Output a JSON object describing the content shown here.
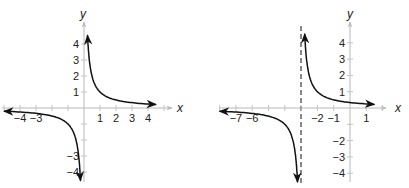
{
  "chart_data": [
    {
      "type": "line",
      "title": "",
      "function": "y = 1/x",
      "xlabel": "x",
      "ylabel": "y",
      "xlim": [
        -5,
        5
      ],
      "ylim": [
        -4.5,
        4.5
      ],
      "grid": false,
      "x_tick_labels": [
        "-4",
        "-3",
        "1",
        "2",
        "3",
        "4"
      ],
      "y_tick_labels": [
        "4",
        "3",
        "2",
        "1",
        "-3",
        "-4"
      ],
      "vertical_asymptote": 0,
      "horizontal_asymptote": 0,
      "series": [
        {
          "name": "right-branch",
          "x": [
            0.22,
            0.5,
            1,
            2,
            3,
            4.5
          ],
          "y": [
            4.5,
            2,
            1,
            0.5,
            0.33,
            0.22
          ]
        },
        {
          "name": "left-branch",
          "x": [
            -5,
            -4,
            -3,
            -2,
            -1,
            -0.5,
            -0.22
          ],
          "y": [
            -0.2,
            -0.25,
            -0.33,
            -0.5,
            -1,
            -2,
            -4.5
          ]
        }
      ]
    },
    {
      "type": "line",
      "title": "",
      "function": "y = 1/(x+3)",
      "xlabel": "x",
      "ylabel": "y",
      "xlim": [
        -8,
        2
      ],
      "ylim": [
        -4.5,
        4.5
      ],
      "grid": false,
      "x_tick_labels": [
        "-7",
        "-6",
        "-2",
        "-1",
        "1"
      ],
      "y_tick_labels": [
        "4",
        "3",
        "2",
        "1",
        "-2",
        "-3",
        "-4"
      ],
      "vertical_asymptote": -3,
      "vertical_asymptote_style": "dashed",
      "horizontal_asymptote": 0,
      "series": [
        {
          "name": "right-branch",
          "x": [
            -2.78,
            -2.5,
            -2,
            -1,
            0,
            1.5
          ],
          "y": [
            4.5,
            2,
            1,
            0.5,
            0.33,
            0.22
          ]
        },
        {
          "name": "left-branch",
          "x": [
            -8,
            -7,
            -6,
            -5,
            -4,
            -3.5,
            -3.22
          ],
          "y": [
            -0.2,
            -0.25,
            -0.33,
            -0.5,
            -1,
            -2,
            -4.5
          ]
        }
      ]
    }
  ],
  "graph1": {
    "x_axis_label": "x",
    "y_axis_label": "y",
    "x_ticks": [
      {
        "v": -4,
        "label": "−4"
      },
      {
        "v": -3,
        "label": "−3"
      },
      {
        "v": 1,
        "label": "1"
      },
      {
        "v": 2,
        "label": "2"
      },
      {
        "v": 3,
        "label": "3"
      },
      {
        "v": 4,
        "label": "4"
      }
    ],
    "y_ticks": [
      {
        "v": 4,
        "label": "4"
      },
      {
        "v": 3,
        "label": "3"
      },
      {
        "v": 2,
        "label": "2"
      },
      {
        "v": 1,
        "label": "1"
      },
      {
        "v": -3,
        "label": "−3"
      },
      {
        "v": -4,
        "label": "−4"
      }
    ]
  },
  "graph2": {
    "x_axis_label": "x",
    "y_axis_label": "y",
    "x_ticks": [
      {
        "v": -7,
        "label": "−7"
      },
      {
        "v": -6,
        "label": "−6"
      },
      {
        "v": -2,
        "label": "−2"
      },
      {
        "v": -1,
        "label": "−1"
      },
      {
        "v": 1,
        "label": "1"
      }
    ],
    "y_ticks": [
      {
        "v": 4,
        "label": "4"
      },
      {
        "v": 3,
        "label": "3"
      },
      {
        "v": 2,
        "label": "2"
      },
      {
        "v": 1,
        "label": "1"
      },
      {
        "v": -2,
        "label": "−2"
      },
      {
        "v": -3,
        "label": "−3"
      },
      {
        "v": -4,
        "label": "−4"
      }
    ]
  },
  "colors": {
    "axis": "#b8b8b8",
    "curve": "#111111",
    "text": "#222222",
    "asymptote": "#111111"
  }
}
